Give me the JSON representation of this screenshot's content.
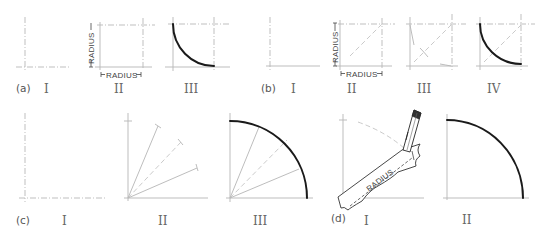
{
  "figure": {
    "panels": [
      {
        "id": "a",
        "label": "(a)",
        "steps": [
          {
            "numeral": "I",
            "description": "two perpendicular construction lines"
          },
          {
            "numeral": "II",
            "description": "radius marked off on both lines forming a square"
          },
          {
            "numeral": "III",
            "description": "quarter arc drawn tangent to both lines"
          }
        ],
        "dimension_labels": [
          "RADIUS",
          "RADIUS"
        ]
      },
      {
        "id": "b",
        "label": "(b)",
        "steps": [
          {
            "numeral": "I",
            "description": "two perpendicular construction lines"
          },
          {
            "numeral": "II",
            "description": "radius square with diagonal"
          },
          {
            "numeral": "III",
            "description": "trial arcs sketched"
          },
          {
            "numeral": "IV",
            "description": "final quarter arc"
          }
        ],
        "dimension_labels": [
          "RADIUS",
          "RADIUS"
        ]
      },
      {
        "id": "c",
        "label": "(c)",
        "steps": [
          {
            "numeral": "I",
            "description": "two perpendicular lines"
          },
          {
            "numeral": "II",
            "description": "radial lines with radius marks"
          },
          {
            "numeral": "III",
            "description": "quarter circle through marks"
          }
        ]
      },
      {
        "id": "d",
        "label": "(d)",
        "steps": [
          {
            "numeral": "I",
            "description": "radius marked on paper strip and swung with pencil"
          },
          {
            "numeral": "II",
            "description": "completed quarter circle"
          }
        ],
        "dimension_labels": [
          "RADIUS"
        ]
      }
    ]
  },
  "text": {
    "a_label": "(a)",
    "a_1": "I",
    "a_2": "II",
    "a_3": "III",
    "a_radius_v": "RADIUS",
    "a_radius_h": "RADIUS",
    "b_label": "(b)",
    "b_1": "I",
    "b_2": "II",
    "b_3": "III",
    "b_4": "IV",
    "b_radius_v": "RADIUS",
    "b_radius_h": "RADIUS",
    "c_label": "(c)",
    "c_1": "I",
    "c_2": "II",
    "c_3": "III",
    "d_label": "(d)",
    "d_1": "I",
    "d_2": "II",
    "d_radius": "RADIUS"
  },
  "colors": {
    "background": "#ffffff",
    "arc": "#1a1a1a",
    "construction": "#b8b8b8",
    "text": "#555555"
  }
}
